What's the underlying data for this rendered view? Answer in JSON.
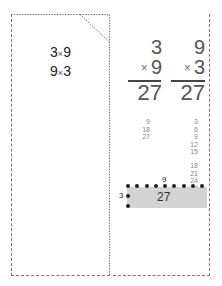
{
  "left_card": {
    "facts": [
      {
        "a": "3",
        "op": "×",
        "b": "9"
      },
      {
        "a": "9",
        "op": "×",
        "b": "3"
      }
    ]
  },
  "right_card": {
    "problems": [
      {
        "top": "3",
        "op": "×",
        "bottom": "9",
        "result": "27",
        "skip_count": [
          "9",
          "18",
          "27"
        ]
      },
      {
        "top": "9",
        "op": "×",
        "bottom": "3",
        "result": "27",
        "skip_count": [
          "3",
          "6",
          "9",
          "12",
          "15",
          "18",
          "21",
          "24",
          "27"
        ]
      }
    ],
    "array_model": {
      "columns_label": "9",
      "rows_label": "3",
      "area_label": "27",
      "columns": 9,
      "rows": 3,
      "fill_color": "#d3d3d3",
      "dot_color": "#222222"
    }
  },
  "colors": {
    "border": "#777777",
    "text": "#333333",
    "muted": "#888888"
  }
}
